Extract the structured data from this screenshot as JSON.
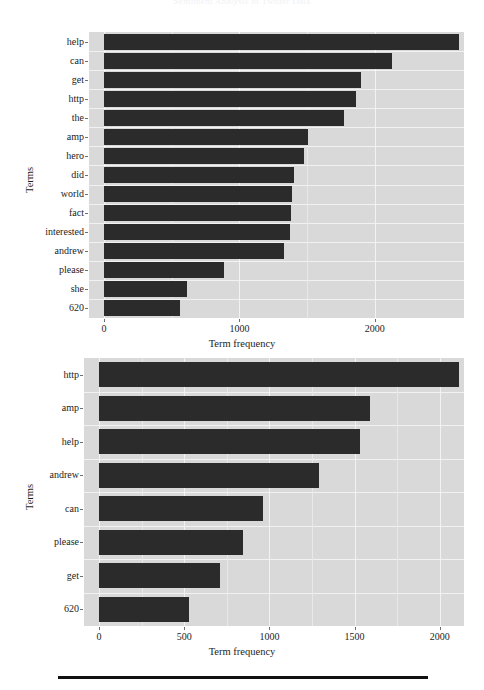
{
  "page": {
    "running_head": "Sentiment Analysis of Twitter Data",
    "bottom_rule": true
  },
  "chart_data": [
    {
      "id": "chart-top",
      "type": "bar",
      "orientation": "horizontal",
      "title": "",
      "xlabel": "Term frequency",
      "ylabel": "Terms",
      "xlim": [
        0,
        2770
      ],
      "xticks": [
        0,
        1000,
        2000
      ],
      "xticklabels": [
        "0",
        "1000",
        "2000"
      ],
      "grid": true,
      "panel_color": "#d9d9d9",
      "bar_color": "#2b2b2b",
      "categories": [
        "help",
        "can",
        "get",
        "http",
        "the",
        "amp",
        "hero",
        "did",
        "world",
        "fact",
        "interested",
        "andrew",
        "please",
        "she",
        "620"
      ],
      "values": [
        2620,
        2125,
        1900,
        1860,
        1770,
        1510,
        1480,
        1400,
        1390,
        1380,
        1375,
        1330,
        890,
        615,
        565
      ]
    },
    {
      "id": "chart-bottom",
      "type": "bar",
      "orientation": "horizontal",
      "title": "",
      "xlabel": "Term frequency",
      "ylabel": "Terms",
      "xlim": [
        0,
        2230
      ],
      "xticks": [
        0,
        500,
        1000,
        1500,
        2000
      ],
      "xticklabels": [
        "0",
        "500",
        "1000",
        "1500",
        "2000"
      ],
      "grid": true,
      "panel_color": "#d9d9d9",
      "bar_color": "#2b2b2b",
      "categories": [
        "http",
        "amp",
        "help",
        "andrew",
        "can",
        "please",
        "get",
        "620"
      ],
      "values": [
        2110,
        1590,
        1530,
        1290,
        965,
        845,
        710,
        530
      ]
    }
  ]
}
